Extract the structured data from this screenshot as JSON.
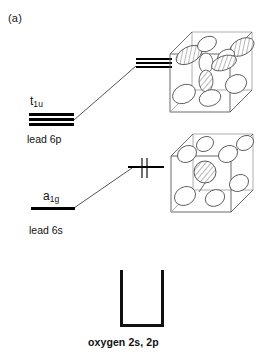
{
  "figure": {
    "panel_label": "(a)",
    "type": "molecular-orbital-energy-level-diagram"
  },
  "levels": {
    "t1u": {
      "symbol_main": "t",
      "symbol_sub": "1u",
      "orbital_label": "lead 6p",
      "degeneracy": 3,
      "occupied": false
    },
    "a1g": {
      "symbol_main": "a",
      "symbol_sub": "1g",
      "orbital_label": "lead 6s",
      "degeneracy": 1,
      "occupied": false
    },
    "right_upper": {
      "degeneracy": 3,
      "occupied": false,
      "electrons": 0
    },
    "right_lower": {
      "degeneracy": 1,
      "occupied": true,
      "electrons": 2,
      "electron_spins": [
        "up",
        "down"
      ]
    }
  },
  "band": {
    "label": "oxygen 2s, 2p"
  },
  "cubes": {
    "upper": {
      "name": "p-orbital-cube",
      "contents": "hatched and white p-orbital lobes at cube faces and center"
    },
    "lower": {
      "name": "s-orbital-cube",
      "contents": "hatched s-orbital sphere at cube center with white lobes at corners"
    }
  },
  "colors": {
    "line": "#000000",
    "cube_edge": "#5a5a5a",
    "connector": "#555555",
    "text": "#111111",
    "background": "#ffffff"
  }
}
